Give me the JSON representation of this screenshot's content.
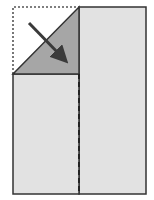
{
  "diagram": {
    "title": "",
    "colors": {
      "paper": "#e2e2e2",
      "folded_flap": "#a6a6a6",
      "outline": "#333333",
      "arrow": "#3a3a3a",
      "dotted_outline": "#555555",
      "crease": "#222222"
    },
    "elements": [
      {
        "name": "original-corner-outline",
        "style": "dotted"
      },
      {
        "name": "folded-triangle-flap",
        "style": "filled"
      },
      {
        "name": "fold-arrow",
        "direction": "down-right"
      },
      {
        "name": "center-crease",
        "style": "dashed"
      }
    ]
  }
}
